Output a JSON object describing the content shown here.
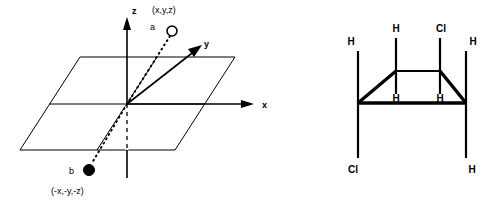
{
  "figure": {
    "panels": [
      {
        "id": "coordinate-axes-diagram",
        "name": "inversion-center-diagram",
        "axes": [
          {
            "key": "z",
            "label": "z"
          },
          {
            "key": "y",
            "label": "y"
          },
          {
            "key": "x",
            "label": "x"
          }
        ],
        "points": [
          {
            "key": "a",
            "label": "a",
            "coordinate_label": "(x,y,z)",
            "marker": "open-circle"
          },
          {
            "key": "b",
            "label": "b",
            "coordinate_label": "(-x,-y,-z)",
            "marker": "filled-circle"
          }
        ],
        "colors": {
          "line": "#000000",
          "marker_fill": "#000000",
          "marker_open_fill": "#ffffff"
        }
      },
      {
        "id": "molecule-diagram",
        "name": "cyclohexane-ring-chair-diagram",
        "atoms": [
          {
            "key": "h-upper-left",
            "label": "H"
          },
          {
            "key": "h-top-left",
            "label": "H"
          },
          {
            "key": "cl-top-right",
            "label": "Cl"
          },
          {
            "key": "h-upper-right",
            "label": "H"
          },
          {
            "key": "h-inner-left",
            "label": "H"
          },
          {
            "key": "h-inner-right",
            "label": "H"
          },
          {
            "key": "cl-bottom-left",
            "label": "Cl"
          },
          {
            "key": "h-bottom-right",
            "label": "H"
          }
        ],
        "colors": {
          "bond": "#000000"
        }
      }
    ]
  }
}
